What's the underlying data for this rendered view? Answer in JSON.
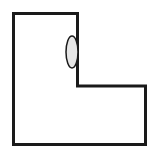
{
  "diagram": {
    "colors": {
      "background": "#ffffff",
      "stroke": "#1a1a1a",
      "oval_fill": "#e6e6e6"
    },
    "outline_points": "13.5,13.5 77.5,13.5 77.5,86 145.5,86 145.5,144.5 13.5,144.5",
    "oval": {
      "cx": 72,
      "cy": 52,
      "rx": 6,
      "ry": 16
    }
  }
}
